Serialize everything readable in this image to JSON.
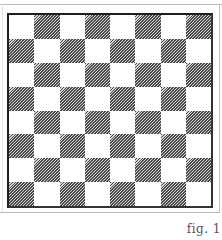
{
  "figure": {
    "caption": "fig. 1",
    "board": {
      "rows": 8,
      "columns": 8,
      "top_left_square": "white",
      "light_color": "#ffffff",
      "dark_pattern": "diagonal-hatch",
      "dark_color": "#4a4a4a",
      "border_color": "#1e1e1e"
    }
  }
}
